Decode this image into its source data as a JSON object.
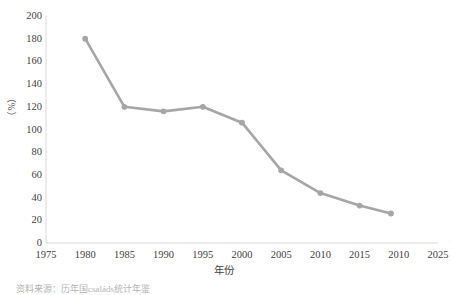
{
  "chart_data": {
    "type": "line",
    "title": "",
    "xlabel": "年份",
    "ylabel": "（%）",
    "xlim": [
      1975,
      2025
    ],
    "ylim": [
      0,
      200
    ],
    "grid": false,
    "legend": null,
    "line_color": "#a6a6a6",
    "marker": "circle",
    "marker_color": "#a6a6a6",
    "x_ticks": [
      "1975",
      "1980",
      "1985",
      "1990",
      "1995",
      "2000",
      "2005",
      "2010",
      "2015",
      "2010",
      "2025"
    ],
    "x_tick_values": [
      1975,
      1980,
      1985,
      1990,
      1995,
      2000,
      2005,
      2010,
      2015,
      2020,
      2025
    ],
    "y_ticks": [
      "0",
      "20",
      "40",
      "60",
      "80",
      "100",
      "120",
      "140",
      "160",
      "180",
      "200"
    ],
    "y_tick_values": [
      0,
      20,
      40,
      60,
      80,
      100,
      120,
      140,
      160,
      180,
      200
    ],
    "x": [
      1980,
      1985,
      1990,
      1995,
      2000,
      2005,
      2010,
      2015,
      2019
    ],
    "values": [
      180,
      120,
      116,
      120,
      106,
      64,
      44,
      33,
      26
    ]
  },
  "caption": {
    "text": "资料来源：历年国családs统计年鉴"
  },
  "axes": {
    "x_axis_name": "year-axis",
    "y_axis_name": "percent-axis"
  }
}
